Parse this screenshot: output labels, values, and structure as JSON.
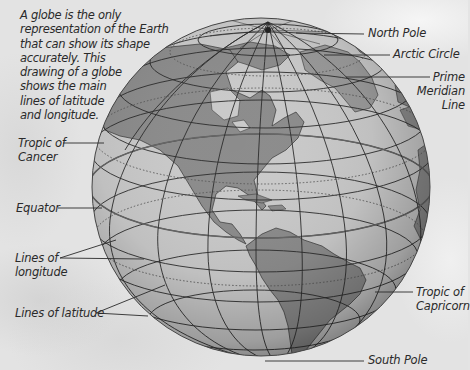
{
  "intro": {
    "lines": [
      "A globe is the only",
      "representation of the Earth",
      "that can show its shape",
      "accurately. This",
      "drawing of a globe",
      "shows the main",
      "lines of latitude",
      "and longitude."
    ]
  },
  "labels": {
    "north_pole": "North Pole",
    "arctic_circle": "Arctic Circle",
    "prime_meridian": [
      "Prime",
      "Meridian",
      "Line"
    ],
    "tropic_of_cancer": [
      "Tropic of",
      "Cancer"
    ],
    "equator": "Equator",
    "lines_of_longitude": [
      "Lines of",
      "longitude"
    ],
    "lines_of_latitude": "Lines of latitude",
    "tropic_of_capricorn": [
      "Tropic of",
      "Capricorn"
    ],
    "south_pole": "South Pole"
  },
  "colors": {
    "ocean": "#cacaca",
    "land": "#8c8c8c",
    "grid": "#2b2b2b",
    "background": "#e3e3e3",
    "text": "#2a2a2a"
  }
}
